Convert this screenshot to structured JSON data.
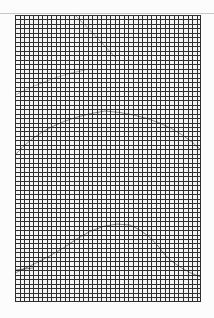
{
  "chart": {
    "type": "stitch-grid",
    "columns": 41,
    "rows": 64,
    "grid_color": "#2e2e2e",
    "background_color": "#f4f4f4",
    "pattern_arcs": [
      {
        "name": "upper-arc",
        "description": "faint arc near top third"
      },
      {
        "name": "middle-arc",
        "description": "faint arc around middle"
      },
      {
        "name": "lower-arc",
        "description": "arc in lower portion"
      }
    ]
  }
}
